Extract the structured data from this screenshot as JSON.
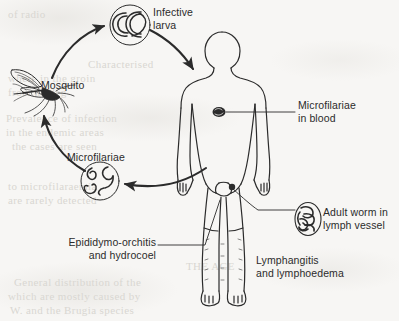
{
  "diagram": {
    "background_color": "#f7f6f4",
    "ink_color": "#2b2b2b",
    "labels": {
      "infective_larva_line1": "Infective",
      "infective_larva_line2": "larva",
      "mosquito": "Mosquito",
      "microfilariae_cycle": "Microfilariae",
      "microfilariae_blood_line1": "Microfilariae",
      "microfilariae_blood_line2": "in blood",
      "adult_worm_line1": "Adult worm in",
      "adult_worm_line2": "lymph vessel",
      "epididymo_line1": "Epididymo-orchitis",
      "epididymo_line2": "and hydrocoel",
      "lymphangitis_line1": "Lymphangitis",
      "lymphangitis_line2": "and lymphoedema"
    },
    "nodes": [
      {
        "id": "infective-larva",
        "shape": "circle",
        "cx": 130,
        "cy": 25,
        "r": 20
      },
      {
        "id": "mosquito",
        "shape": "illustration",
        "cx": 38,
        "cy": 92
      },
      {
        "id": "microfilariae",
        "shape": "circle",
        "cx": 100,
        "cy": 181,
        "r": 19
      },
      {
        "id": "human-body",
        "shape": "silhouette",
        "cx": 222,
        "cy": 175
      },
      {
        "id": "adult-worm",
        "shape": "ellipse",
        "cx": 308,
        "cy": 219,
        "rx": 13,
        "ry": 16
      },
      {
        "id": "microfilariae-dot-chest",
        "shape": "blob",
        "cx": 219,
        "cy": 112
      },
      {
        "id": "groin-dot",
        "shape": "dot",
        "cx": 232,
        "cy": 187
      }
    ],
    "arrows": [
      {
        "id": "mosquito-to-larva",
        "from": "mosquito",
        "to": "infective-larva"
      },
      {
        "id": "larva-to-human",
        "from": "infective-larva",
        "to": "human-body"
      },
      {
        "id": "human-to-microfilariae",
        "from": "human-body",
        "to": "microfilariae"
      },
      {
        "id": "microfilariae-to-mosquito",
        "from": "microfilariae",
        "to": "mosquito"
      }
    ],
    "leader_lines": [
      {
        "id": "leader-microfilariae-blood",
        "from": "microfilariae-dot-chest",
        "to": "microfilariae_blood_label"
      },
      {
        "id": "leader-adult-worm",
        "from": "groin-dot",
        "to": "adult_worm_label"
      },
      {
        "id": "leader-epididymo",
        "from": "epididymo_label",
        "to": "groin-region"
      }
    ],
    "ghost_text": [
      {
        "text": "of radio",
        "x": 8,
        "y": 14
      },
      {
        "text": "Characterised",
        "x": 88,
        "y": 64
      },
      {
        "text": "where  in  the  groin",
        "x": 8,
        "y": 78
      },
      {
        "text": "from the leg",
        "x": 8,
        "y": 92
      },
      {
        "text": "Prevalence of infection",
        "x": 6,
        "y": 118
      },
      {
        "text": "in  the  endemic  areas",
        "x": 6,
        "y": 132
      },
      {
        "text": "the cases are seen",
        "x": 12,
        "y": 146
      },
      {
        "text": "to microfilaraemia",
        "x": 8,
        "y": 186
      },
      {
        "text": "are  rarely  detected",
        "x": 8,
        "y": 200
      },
      {
        "text": "THE AGE",
        "x": 186,
        "y": 266
      },
      {
        "text": "General  distribution of the",
        "x": 14,
        "y": 282
      },
      {
        "text": "which  are  mostly  caused by",
        "x": 8,
        "y": 296
      },
      {
        "text": "W.  and  the  Brugia  species",
        "x": 10,
        "y": 310
      }
    ]
  }
}
